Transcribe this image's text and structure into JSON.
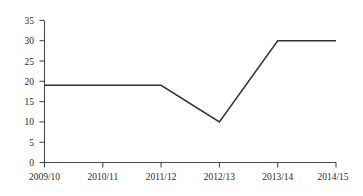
{
  "chart_data": {
    "type": "line",
    "title": "",
    "subtitle": "",
    "xlabel": "",
    "ylabel": "",
    "categories": [
      "2009/10",
      "2010/11",
      "2011/12",
      "2012/13",
      "2013/14",
      "2014/15"
    ],
    "values": [
      19,
      19,
      19,
      10,
      30,
      30
    ],
    "series": [
      {
        "name": "",
        "values": [
          19,
          19,
          19,
          10,
          30,
          30
        ]
      }
    ],
    "ylim": [
      0,
      35
    ],
    "yticks": [
      0,
      5,
      10,
      15,
      20,
      25,
      30,
      35
    ],
    "ytick_labels": [
      "0",
      "5",
      "10",
      "15",
      "20",
      "25",
      "30",
      "35"
    ],
    "xtick_labels": [
      "2009/10",
      "2010/11",
      "2011/12",
      "2012/13",
      "2013/14",
      "2014/15"
    ],
    "grid": false,
    "legend": false,
    "legend_position": "none",
    "line_color": "#333333",
    "axis_color": "#4a4a4a",
    "background_color": "#ffffff",
    "markers": false
  },
  "axes": {
    "y_tick_0": "0",
    "y_tick_1": "5",
    "y_tick_2": "10",
    "y_tick_3": "15",
    "y_tick_4": "20",
    "y_tick_5": "25",
    "y_tick_6": "30",
    "y_tick_7": "35",
    "x_tick_0": "2009/10",
    "x_tick_1": "2010/11",
    "x_tick_2": "2011/12",
    "x_tick_3": "2012/13",
    "x_tick_4": "2013/14",
    "x_tick_5": "2014/15"
  }
}
